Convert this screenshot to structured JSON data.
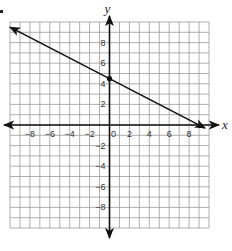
{
  "chart_data": {
    "type": "line",
    "title": "",
    "xlabel": "x",
    "ylabel": "y",
    "xlim": [
      -10,
      10
    ],
    "ylim": [
      -10,
      10
    ],
    "grid": true,
    "x_ticks": [
      -8,
      -6,
      -4,
      -2,
      0,
      2,
      4,
      6,
      8
    ],
    "y_ticks": [
      -8,
      -6,
      -4,
      -2,
      2,
      4,
      6,
      8
    ],
    "x_tick_labels": [
      "−8",
      "−6",
      "−4",
      "−2",
      "0",
      "2",
      "4",
      "6",
      "8"
    ],
    "y_tick_labels": [
      "−8",
      "−6",
      "−4",
      "−2",
      "2",
      "4",
      "6",
      "8"
    ],
    "series": [
      {
        "name": "line",
        "equation": "y = -0.5x + 4.5",
        "slope": -0.5,
        "intercept": 4.5,
        "x": [
          -10,
          9.6
        ],
        "y": [
          9.5,
          -0.3
        ],
        "arrows": "both"
      }
    ],
    "points": [
      {
        "x": 0,
        "y": 4.5,
        "label": "y-intercept"
      }
    ]
  }
}
